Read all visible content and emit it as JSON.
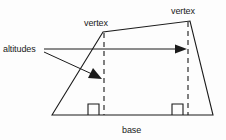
{
  "figure": {
    "background_color": "#fdfdfd",
    "ink_color": "#1b1b1b",
    "labels": {
      "altitudes": "altitudes",
      "vertex_left": "vertex",
      "vertex_right": "vertex",
      "base": "base"
    },
    "geometry": {
      "shape_points": "52,115 103,32 190,21 213,115",
      "base_line": {
        "x1": 52,
        "y1": 115,
        "x2": 213,
        "y2": 115
      },
      "altitude_left": {
        "x": 104,
        "y1": 33,
        "y2": 115
      },
      "altitude_right": {
        "x": 188,
        "y1": 22,
        "y2": 115
      },
      "right_angle_left": {
        "x": 88,
        "y": 104,
        "size": 11
      },
      "right_angle_right": {
        "x": 172,
        "y": 104,
        "size": 11
      },
      "leader_horizontal": {
        "x1": 44,
        "y1": 49,
        "x2": 182,
        "y2": 49
      },
      "leader_diagonal": {
        "x1": 44,
        "y1": 52,
        "x2": 96,
        "y2": 76
      }
    },
    "label_positions": {
      "altitudes": {
        "x": 3,
        "y": 52
      },
      "vertex_left": {
        "x": 84,
        "y": 26
      },
      "vertex_right": {
        "x": 171,
        "y": 14
      },
      "base": {
        "x": 122,
        "y": 133
      }
    }
  }
}
